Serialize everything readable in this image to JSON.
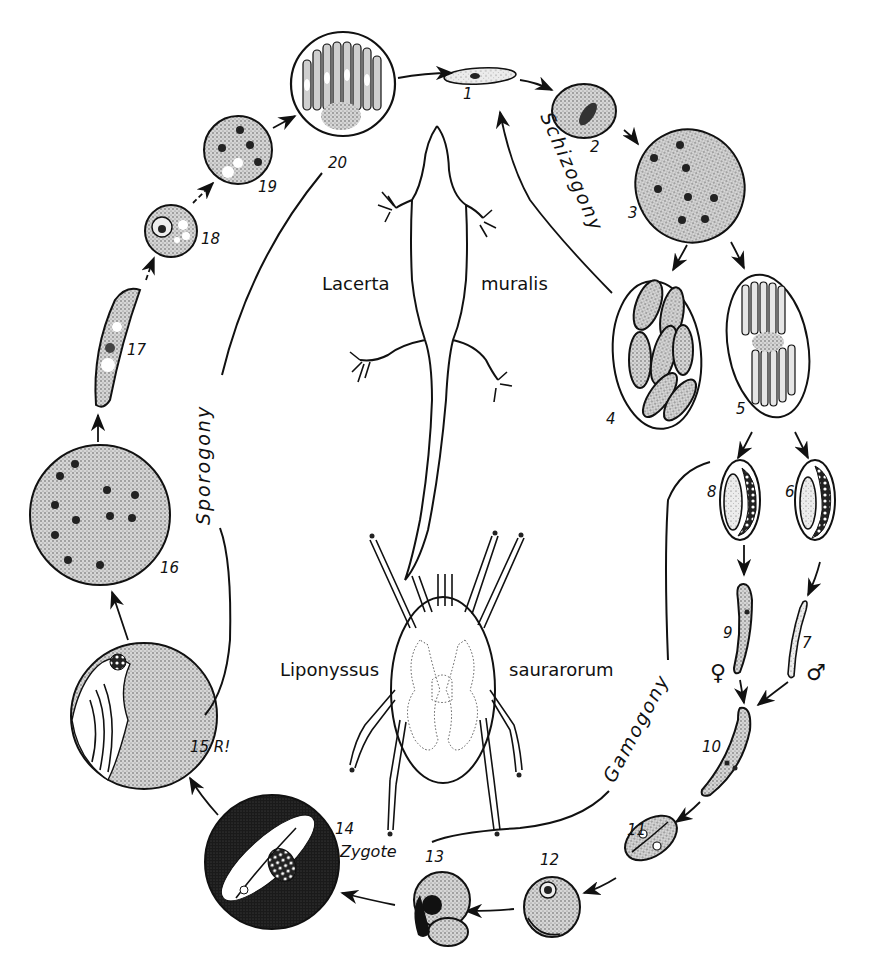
{
  "figure": {
    "type": "life-cycle diagram",
    "hosts": {
      "vertebrate": {
        "genus": "Lacerta",
        "species": "muralis"
      },
      "vector": {
        "genus": "Liponyssus",
        "species": "saurarorum"
      }
    },
    "phases": {
      "schizogony": "Schizogony",
      "gamogony": "Gamogony",
      "sporogony": "Sporogony"
    },
    "stages": [
      {
        "id": "1",
        "label": "1"
      },
      {
        "id": "2",
        "label": "2"
      },
      {
        "id": "3",
        "label": "3"
      },
      {
        "id": "4",
        "label": "4"
      },
      {
        "id": "5",
        "label": "5"
      },
      {
        "id": "6",
        "label": "6"
      },
      {
        "id": "7",
        "label": "7"
      },
      {
        "id": "8",
        "label": "8"
      },
      {
        "id": "9",
        "label": "9"
      },
      {
        "id": "10",
        "label": "10"
      },
      {
        "id": "11",
        "label": "11"
      },
      {
        "id": "12",
        "label": "12"
      },
      {
        "id": "13",
        "label": "13"
      },
      {
        "id": "14",
        "label": "14"
      },
      {
        "id": "15",
        "label": "15 R!"
      },
      {
        "id": "16",
        "label": "16"
      },
      {
        "id": "17",
        "label": "17"
      },
      {
        "id": "18",
        "label": "18"
      },
      {
        "id": "19",
        "label": "19"
      },
      {
        "id": "20",
        "label": "20"
      }
    ],
    "annotations": {
      "zygote": "Zygote",
      "female_symbol": "♀",
      "male_symbol": "♂"
    }
  }
}
